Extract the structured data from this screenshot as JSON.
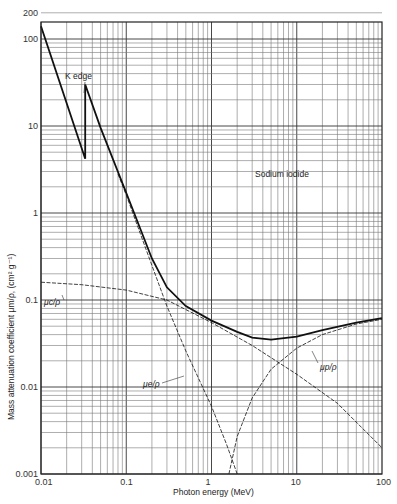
{
  "chart_data": {
    "type": "line",
    "title": "Sodium iodide",
    "xlabel": "Photon energy (MeV)",
    "ylabel": "Mass attenuation coefficient μm/ρ, (cm² g⁻¹)",
    "xscale": "log",
    "yscale": "log",
    "xlim": [
      0.01,
      100
    ],
    "ylim": [
      0.001,
      200
    ],
    "grid": true,
    "x_ticks": [
      "0.01",
      "0.1",
      "1",
      "10",
      "100"
    ],
    "y_ticks": [
      "0.001",
      "0.01",
      "0.1",
      "1",
      "10",
      "100",
      "200"
    ],
    "annotations": [
      "K edge",
      "Sodium iodide",
      "μc/ρ",
      "μe/ρ",
      "μp/ρ"
    ],
    "series": [
      {
        "name": "μm/ρ (total)",
        "style": "thick solid",
        "x": [
          0.01,
          0.033,
          0.033,
          0.05,
          0.1,
          0.2,
          0.3,
          0.5,
          1,
          2,
          3,
          5,
          10,
          20,
          50,
          100
        ],
        "y": [
          140,
          4.2,
          30,
          9.5,
          1.7,
          0.3,
          0.14,
          0.085,
          0.058,
          0.043,
          0.037,
          0.035,
          0.038,
          0.045,
          0.055,
          0.062
        ]
      },
      {
        "name": "μc/ρ (Compton)",
        "style": "thin dashed",
        "x": [
          0.01,
          0.03,
          0.1,
          0.3,
          1,
          3,
          10,
          30,
          100
        ],
        "y": [
          0.16,
          0.15,
          0.13,
          0.1,
          0.055,
          0.03,
          0.014,
          0.0065,
          0.002
        ]
      },
      {
        "name": "μe/ρ (photoelectric)",
        "style": "thin dashed",
        "x": [
          0.08,
          0.1,
          0.2,
          0.3,
          0.5,
          1,
          1.5,
          2
        ],
        "y": [
          2.8,
          1.6,
          0.25,
          0.085,
          0.026,
          0.006,
          0.0022,
          0.001
        ]
      },
      {
        "name": "μp/ρ (pair production)",
        "style": "thin dashed",
        "x": [
          1.6,
          2,
          3,
          5,
          10,
          20,
          50,
          100
        ],
        "y": [
          0.001,
          0.0027,
          0.0075,
          0.016,
          0.028,
          0.04,
          0.053,
          0.06
        ]
      }
    ]
  },
  "labels": {
    "title": "Sodium iodide",
    "xlabel": "Photon energy (MeV)",
    "ylabel": "Mass attenuation coefficient μm/ρ, (cm² g⁻¹)",
    "k_edge": "K edge",
    "mu_c": "μc/ρ",
    "mu_e": "μe/ρ",
    "mu_p": "μp/ρ"
  }
}
